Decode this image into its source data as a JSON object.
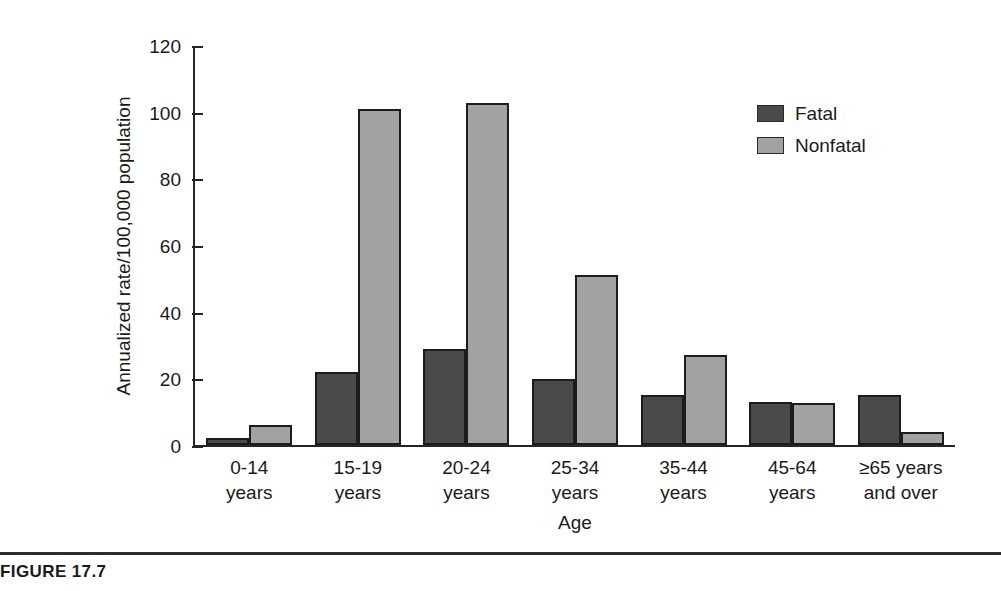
{
  "figure": {
    "caption": "FIGURE 17.7"
  },
  "legend": {
    "position": "top-right",
    "items": [
      {
        "label": "Fatal",
        "swatch": "fatal-swatch",
        "color": "#4a4a4a"
      },
      {
        "label": "Nonfatal",
        "swatch": "nonfatal-swatch",
        "color": "#a2a2a2"
      }
    ]
  },
  "chart_data": {
    "type": "bar",
    "title": "",
    "subtitle": "",
    "xlabel": "Age",
    "ylabel": "Annualized rate/100,000 population",
    "categories": [
      "0-14 years",
      "15-19 years",
      "20-24 years",
      "25-34 years",
      "35-44 years",
      "45-64 years",
      "≥65 years and over"
    ],
    "category_lines": [
      [
        "0-14",
        "years"
      ],
      [
        "15-19",
        "years"
      ],
      [
        "20-24",
        "years"
      ],
      [
        "25-34",
        "years"
      ],
      [
        "35-44",
        "years"
      ],
      [
        "45-64",
        "years"
      ],
      [
        "≥65 years",
        "and over"
      ]
    ],
    "series": [
      {
        "name": "Fatal",
        "color": "#4a4a4a",
        "values": [
          2,
          22,
          29,
          20,
          15,
          13,
          15
        ]
      },
      {
        "name": "Nonfatal",
        "color": "#a2a2a2",
        "values": [
          6,
          101,
          103,
          51,
          27,
          12.5,
          4
        ]
      }
    ],
    "ylim": [
      0,
      120
    ],
    "yticks": [
      0,
      20,
      40,
      60,
      80,
      100,
      120
    ],
    "ytick_labels": [
      "0",
      "20",
      "40",
      "60",
      "80",
      "100",
      "120"
    ],
    "grid": false,
    "legend_position": "top-right"
  }
}
